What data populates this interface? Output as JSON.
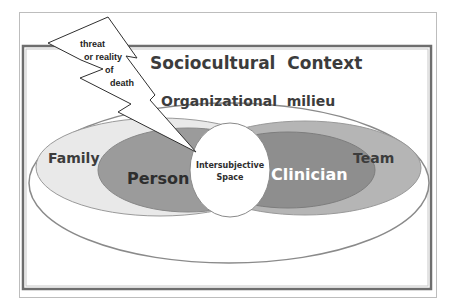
{
  "diagram": {
    "title": "Sociocultural Context",
    "labels": {
      "sociocultural": "Sociocultural  Context",
      "organizational": "Organizational  milieu",
      "family": "Family",
      "person": "Person",
      "team": "Team",
      "clinician": "Clinician",
      "intersubjective_line1": "Intersubjective",
      "intersubjective_line2": "Space",
      "bolt_line1": "threat",
      "bolt_line2": "or reality",
      "bolt_line3": "of",
      "bolt_line4": "death"
    },
    "colors": {
      "background": "#ffffff",
      "frame_outer": "#b8b8b8",
      "frame_inner": "#6e6e6e",
      "org_stroke": "#8a8a8a",
      "family_fill": "#e9e9e9",
      "person_fill": "#9b9b9b",
      "team_fill": "#b5b5b5",
      "clinician_fill": "#8e8e8e",
      "circle_fill": "#ffffff",
      "text_dark": "#3c3c3c",
      "text_light": "#ffffff"
    }
  }
}
